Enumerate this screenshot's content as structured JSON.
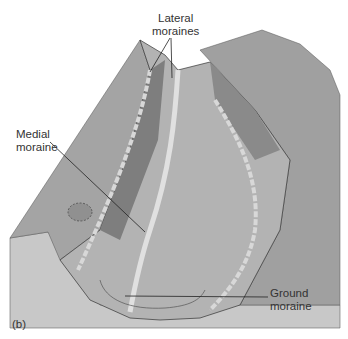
{
  "figure": {
    "panel_label": "(b)",
    "labels": {
      "lateral": [
        "Lateral",
        "moraines"
      ],
      "medial": [
        "Medial",
        "moraine"
      ],
      "ground": [
        "Ground",
        "moraine"
      ]
    },
    "colors": {
      "front_face": "#c8c8c8",
      "top_surface": "#a8a8a8",
      "dark_surface": "#8a8a8a",
      "ice": "#b5b5b5",
      "moraine_stripe": "#dcdcdc",
      "line": "#222222"
    }
  }
}
